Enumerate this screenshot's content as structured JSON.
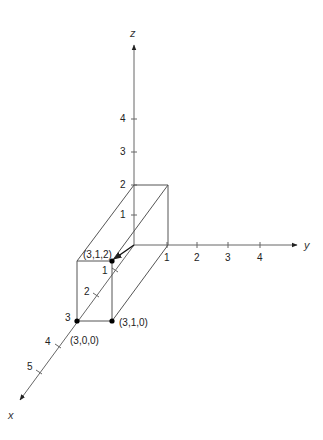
{
  "axes": {
    "x": {
      "name": "x",
      "ticks": [
        "1",
        "2",
        "3",
        "4",
        "5"
      ]
    },
    "y": {
      "name": "y",
      "ticks": [
        "1",
        "2",
        "3",
        "4"
      ]
    },
    "z": {
      "name": "z",
      "ticks": [
        "1",
        "2",
        "3",
        "4"
      ]
    }
  },
  "points": {
    "p312": "(3,1,2)",
    "p310": "(3,1,0)",
    "p300": "(3,0,0)"
  },
  "colors": {
    "line": "#555555",
    "point": "#000000",
    "text": "#222222"
  }
}
